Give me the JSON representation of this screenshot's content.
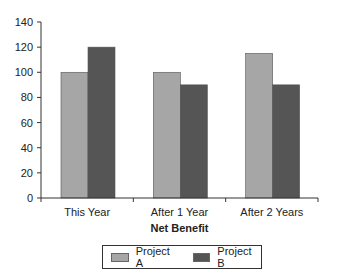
{
  "chart_data": {
    "type": "bar",
    "title": "",
    "xlabel": "Net Benefit",
    "ylabel": "",
    "categories": [
      "This Year",
      "After 1 Year",
      "After 2 Years"
    ],
    "series": [
      {
        "name": "Project A",
        "values": [
          100,
          100,
          115
        ],
        "color": "#a6a6a6"
      },
      {
        "name": "Project B",
        "values": [
          120,
          90,
          90
        ],
        "color": "#555555"
      }
    ],
    "ylim": [
      0,
      140
    ],
    "yticks": [
      0,
      20,
      40,
      60,
      80,
      100,
      120,
      140
    ],
    "grid": false,
    "legend_position": "bottom"
  },
  "legend": {
    "items": [
      {
        "label": "Project A",
        "color": "#a6a6a6"
      },
      {
        "label": "Project B",
        "color": "#555555"
      }
    ]
  }
}
